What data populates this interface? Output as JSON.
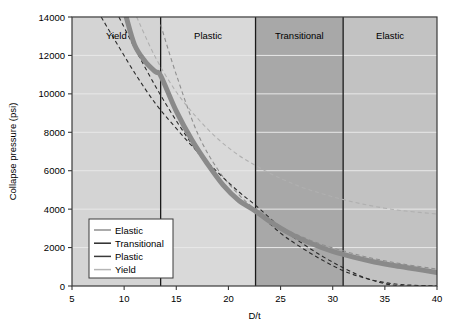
{
  "chart_data": {
    "type": "line",
    "title": "",
    "xlabel": "D/t",
    "ylabel": "Collapse pressure (psi)",
    "xlim": [
      5,
      40
    ],
    "ylim": [
      0,
      14000
    ],
    "xticks": [
      5,
      10,
      15,
      20,
      25,
      30,
      35,
      40
    ],
    "yticks": [
      0,
      2000,
      4000,
      6000,
      8000,
      10000,
      12000,
      14000
    ],
    "grid": true,
    "legend_position": "lower-left",
    "regions": [
      {
        "name": "Yield",
        "x_start": 5,
        "x_end": 13.5,
        "shade": "#d4d4d4"
      },
      {
        "name": "Plastic",
        "x_start": 13.5,
        "x_end": 22.6,
        "shade": "#d9d9d9"
      },
      {
        "name": "Transitional",
        "x_start": 22.6,
        "x_end": 31.0,
        "shade": "#a8a8a8"
      },
      {
        "name": "Elastic",
        "x_start": 31.0,
        "x_end": 40,
        "shade": "#c2c2c2"
      }
    ],
    "series": [
      {
        "name": "Elastic",
        "style": "dashed",
        "color": "#8f8f8f",
        "x": [
          13.5,
          15,
          17,
          19,
          21,
          23,
          25,
          27,
          29,
          31,
          33,
          35,
          37,
          40
        ],
        "y": [
          13600,
          11000,
          8000,
          6050,
          4750,
          3800,
          3100,
          2570,
          2150,
          1830,
          1540,
          1310,
          1120,
          880
        ]
      },
      {
        "name": "Transitional",
        "style": "dashed",
        "color": "#2b2b2b",
        "x": [
          9.5,
          11,
          13,
          15,
          17,
          19,
          21,
          22.6,
          25,
          27,
          29,
          31,
          33,
          35,
          37,
          40
        ],
        "y": [
          14000,
          12400,
          10400,
          8600,
          7000,
          5600,
          4400,
          3900,
          2750,
          2000,
          1350,
          800,
          420,
          180,
          60,
          0
        ]
      },
      {
        "name": "Plastic",
        "style": "dashed",
        "color": "#2b2b2b",
        "x": [
          7.8,
          9,
          11,
          13,
          15,
          17,
          19,
          21,
          22.6,
          25,
          27,
          29,
          31,
          33,
          35,
          37,
          40
        ],
        "y": [
          14000,
          12900,
          11100,
          9500,
          8200,
          7000,
          5900,
          4900,
          4200,
          3050,
          2250,
          1550,
          950,
          450,
          120,
          0,
          0
        ]
      },
      {
        "name": "Yield",
        "style": "dashed",
        "color": "#b0b0b0",
        "x": [
          11.2,
          13,
          15,
          17,
          19,
          21,
          23,
          25,
          27,
          29,
          31,
          33,
          35,
          37,
          40
        ],
        "y": [
          14000,
          11900,
          10100,
          8750,
          7650,
          6800,
          6150,
          5600,
          5150,
          4800,
          4500,
          4250,
          4050,
          3900,
          3750
        ]
      }
    ],
    "envelope": {
      "name": "collapse-envelope",
      "color": "#8a8a8a",
      "width": 5,
      "x": [
        10.2,
        11,
        12,
        13,
        13.5,
        15,
        16.5,
        18,
        19.5,
        21,
        22.6,
        24,
        26,
        28,
        30,
        32,
        34,
        36,
        38,
        40
      ],
      "y": [
        14000,
        12550,
        11700,
        11150,
        10950,
        9100,
        7600,
        6350,
        5250,
        4450,
        3900,
        3350,
        2700,
        2200,
        1800,
        1500,
        1250,
        1050,
        880,
        700
      ]
    },
    "legend_entries": [
      {
        "label": "Elastic",
        "color": "#8f8f8f"
      },
      {
        "label": "Transitional",
        "color": "#2b2b2b"
      },
      {
        "label": "Plastic",
        "color": "#3a3a3a"
      },
      {
        "label": "Yield",
        "color": "#b5b5b5"
      }
    ]
  }
}
